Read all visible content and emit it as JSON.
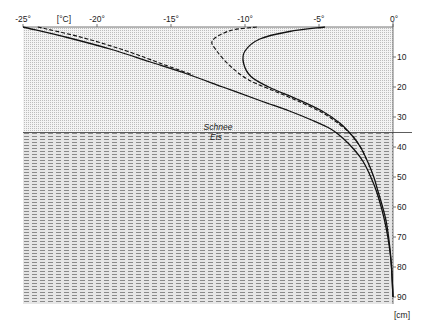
{
  "chart_data": {
    "type": "line",
    "title": "",
    "xlabel": "[°C]",
    "ylabel": "[cm]",
    "xlim": [
      -25,
      0
    ],
    "ylim": [
      0,
      90
    ],
    "y_inverted": true,
    "x_axis_position": "top",
    "y_axis_position": "right",
    "x_ticks": [
      -25,
      -20,
      -15,
      -10,
      -5,
      0
    ],
    "x_tick_labels": [
      "-25°",
      "-20°",
      "-15°",
      "-10°",
      "-5°",
      "0°"
    ],
    "y_ticks": [
      10,
      20,
      30,
      40,
      50,
      60,
      70,
      80,
      90
    ],
    "y_tick_labels": [
      "10",
      "20",
      "30",
      "40",
      "50",
      "60",
      "70",
      "80",
      "90"
    ],
    "grid": false,
    "legend": null,
    "layers": [
      {
        "name": "Schnee",
        "from_depth": 0,
        "to_depth": 35,
        "pattern": "dotted-grid"
      },
      {
        "name": "Eis",
        "from_depth": 35,
        "to_depth": 92,
        "pattern": "dashed-horizontal"
      }
    ],
    "annotations": [
      {
        "text": "Schnee",
        "position": "above boundary",
        "depth": 35
      },
      {
        "text": "Eis",
        "position": "below boundary",
        "depth": 35
      }
    ],
    "series": [
      {
        "name": "profile-1",
        "style": "solid",
        "points": [
          [
            -25,
            0
          ],
          [
            -22,
            3.5
          ],
          [
            -19,
            7.5
          ],
          [
            -16.5,
            11.5
          ],
          [
            -14,
            15.5
          ],
          [
            -11.5,
            20
          ],
          [
            -9,
            24.5
          ],
          [
            -7,
            28
          ],
          [
            -5.5,
            31
          ],
          [
            -4.2,
            34
          ],
          [
            -3.4,
            37
          ],
          [
            -2.6,
            41
          ],
          [
            -2.0,
            45
          ],
          [
            -1.5,
            50
          ],
          [
            -1.1,
            55
          ],
          [
            -0.8,
            60
          ],
          [
            -0.55,
            65
          ],
          [
            -0.35,
            70
          ],
          [
            -0.2,
            75
          ],
          [
            -0.1,
            80
          ],
          [
            -0.05,
            85
          ],
          [
            0,
            90
          ]
        ]
      },
      {
        "name": "profile-2",
        "style": "dashed",
        "points": [
          [
            -24,
            0
          ],
          [
            -21,
            3.5
          ],
          [
            -18,
            8
          ],
          [
            -15.5,
            12.5
          ],
          [
            -13.5,
            16
          ]
        ]
      },
      {
        "name": "profile-3",
        "style": "solid",
        "points": [
          [
            -4.6,
            0
          ],
          [
            -7,
            1.5
          ],
          [
            -9,
            4
          ],
          [
            -10,
            8
          ],
          [
            -10.1,
            12
          ],
          [
            -9.6,
            16.5
          ],
          [
            -8.4,
            20
          ],
          [
            -6.5,
            24
          ],
          [
            -4.8,
            28
          ],
          [
            -3.6,
            32
          ],
          [
            -2.8,
            36
          ],
          [
            -2.2,
            40
          ],
          [
            -1.7,
            45
          ],
          [
            -1.3,
            50
          ],
          [
            -1.0,
            55
          ],
          [
            -0.7,
            60
          ],
          [
            -0.45,
            65
          ],
          [
            -0.3,
            70
          ],
          [
            -0.18,
            75
          ],
          [
            -0.1,
            80
          ],
          [
            -0.05,
            85
          ],
          [
            0,
            90
          ]
        ]
      },
      {
        "name": "profile-4",
        "style": "dashed",
        "points": [
          [
            -9.2,
            0
          ],
          [
            -11,
            1.2
          ],
          [
            -12.2,
            4.5
          ],
          [
            -11.9,
            8
          ],
          [
            -11,
            13
          ],
          [
            -9.8,
            17.5
          ],
          [
            -8.2,
            21
          ],
          [
            -6.5,
            24.5
          ],
          [
            -4.8,
            28.5
          ],
          [
            -3.6,
            32.5
          ],
          [
            -2.8,
            36
          ],
          [
            -2.2,
            40
          ],
          [
            -1.8,
            44
          ]
        ]
      }
    ]
  },
  "axes": {
    "x_unit": "[°C]",
    "y_unit": "[cm]",
    "x_labels": [
      "-25°",
      "-20°",
      "-15°",
      "-10°",
      "-5°",
      "0°"
    ],
    "y_labels": [
      "10",
      "20",
      "30",
      "40",
      "50",
      "60",
      "70",
      "80",
      "90"
    ]
  },
  "labels": {
    "snow": "Schnee",
    "ice": "Eis"
  }
}
